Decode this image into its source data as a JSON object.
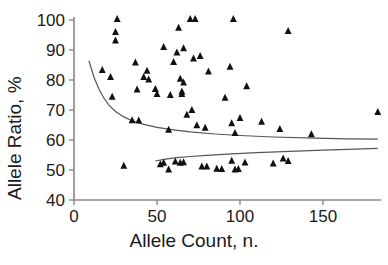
{
  "chart_data": {
    "type": "scatter",
    "title": "",
    "xlabel": "Allele Count, n.",
    "ylabel": "Allele Ratio, %",
    "xlim": [
      0,
      185
    ],
    "ylim": [
      40,
      101
    ],
    "xticks": [
      0,
      50,
      100,
      150
    ],
    "yticks": [
      40,
      50,
      60,
      70,
      80,
      90,
      100
    ],
    "xtick_labels": [
      "0",
      "50",
      "100",
      "150"
    ],
    "ytick_labels": [
      "40",
      "50",
      "60",
      "70",
      "80",
      "90",
      "100"
    ],
    "grid": false,
    "legend": null,
    "marker": "triangle",
    "marker_color": "#111111",
    "line_color": "#555555",
    "series": [
      {
        "name": "Allele ratio observations",
        "points": [
          [
            26,
            100.3
          ],
          [
            70,
            100.3
          ],
          [
            73,
            100.3
          ],
          [
            96,
            100.3
          ],
          [
            25,
            96.0
          ],
          [
            129,
            96.3
          ],
          [
            63,
            97.4
          ],
          [
            25,
            93.2
          ],
          [
            54,
            91.0
          ],
          [
            66,
            90.6
          ],
          [
            62,
            89.2
          ],
          [
            76,
            88.0
          ],
          [
            72,
            87.2
          ],
          [
            37,
            85.8
          ],
          [
            60,
            86.0
          ],
          [
            17,
            83.3
          ],
          [
            44,
            83.1
          ],
          [
            94,
            84.4
          ],
          [
            81,
            82.8
          ],
          [
            22,
            81.0
          ],
          [
            42,
            81.0
          ],
          [
            45,
            80.2
          ],
          [
            64,
            80.4
          ],
          [
            66,
            79.2
          ],
          [
            104,
            77.9
          ],
          [
            49,
            77.0
          ],
          [
            38,
            76.8
          ],
          [
            65,
            76.2
          ],
          [
            65,
            75.3
          ],
          [
            50,
            75.3
          ],
          [
            58,
            75.0
          ],
          [
            23,
            74.4
          ],
          [
            91,
            74.1
          ],
          [
            71,
            70.0
          ],
          [
            68,
            68.4
          ],
          [
            100,
            67.3
          ],
          [
            183,
            69.3
          ],
          [
            35,
            66.6
          ],
          [
            39,
            66.5
          ],
          [
            95,
            65.6
          ],
          [
            113,
            66.1
          ],
          [
            74,
            64.9
          ],
          [
            79,
            64.1
          ],
          [
            124,
            63.7
          ],
          [
            57,
            63.4
          ],
          [
            97,
            62.3
          ],
          [
            143,
            61.9
          ],
          [
            30,
            51.4
          ],
          [
            52,
            51.9
          ],
          [
            54,
            52.4
          ],
          [
            57,
            50.2
          ],
          [
            61,
            52.8
          ],
          [
            64,
            52.4
          ],
          [
            66,
            52.6
          ],
          [
            77,
            51.2
          ],
          [
            80,
            51.2
          ],
          [
            86,
            50.4
          ],
          [
            89,
            50.3
          ],
          [
            95,
            53.1
          ],
          [
            97,
            50.2
          ],
          [
            99,
            50.3
          ],
          [
            103,
            52.5
          ],
          [
            120,
            52.2
          ],
          [
            126,
            53.8
          ],
          [
            129,
            53.0
          ]
        ]
      }
    ],
    "fit_lines": [
      {
        "name": "upper-confidence-curve",
        "points": [
          [
            9,
            86.4
          ],
          [
            12,
            81.0
          ],
          [
            15,
            77.0
          ],
          [
            18,
            74.0
          ],
          [
            21,
            71.6
          ],
          [
            25,
            69.5
          ],
          [
            30,
            67.7
          ],
          [
            35,
            66.4
          ],
          [
            42,
            65.2
          ],
          [
            50,
            64.2
          ],
          [
            60,
            63.4
          ],
          [
            70,
            62.7
          ],
          [
            85,
            62.0
          ],
          [
            100,
            61.5
          ],
          [
            120,
            61.0
          ],
          [
            145,
            60.6
          ],
          [
            165,
            60.4
          ],
          [
            183,
            60.3
          ]
        ]
      },
      {
        "name": "lower-confidence-curve",
        "points": [
          [
            49,
            53.0
          ],
          [
            55,
            53.6
          ],
          [
            62,
            54.1
          ],
          [
            70,
            54.5
          ],
          [
            80,
            54.9
          ],
          [
            95,
            55.4
          ],
          [
            110,
            55.8
          ],
          [
            130,
            56.2
          ],
          [
            150,
            56.6
          ],
          [
            165,
            56.9
          ],
          [
            183,
            57.2
          ]
        ]
      }
    ]
  }
}
